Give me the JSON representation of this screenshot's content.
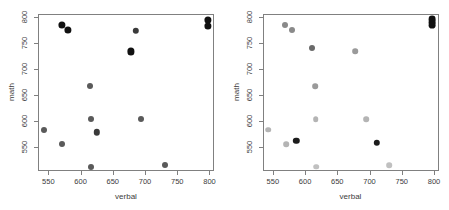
{
  "figure": {
    "panels": [
      {
        "name": "left-panel",
        "xlabel": "verbal",
        "ylabel": "math",
        "xticks": [
          550,
          600,
          650,
          700,
          750,
          800
        ],
        "xticklabels": [
          "550",
          "600",
          "650",
          "700",
          "750",
          "800"
        ],
        "yticks": [
          550,
          600,
          650,
          700,
          750,
          800
        ],
        "yticklabels": [
          "550",
          "600",
          "650",
          "700",
          "750",
          "800"
        ],
        "xlim": [
          534,
          807
        ],
        "ylim": [
          503,
          805
        ]
      },
      {
        "name": "right-panel",
        "xlabel": "verbal",
        "ylabel": "math",
        "xticks": [
          550,
          600,
          650,
          700,
          750,
          800
        ],
        "xticklabels": [
          "550",
          "600",
          "650",
          "700",
          "750",
          "800"
        ],
        "yticks": [
          550,
          600,
          650,
          700,
          750,
          800
        ],
        "yticklabels": [
          "550",
          "600",
          "650",
          "700",
          "750",
          "800"
        ],
        "xlim": [
          534,
          807
        ],
        "ylim": [
          503,
          805
        ]
      }
    ]
  },
  "chart_data": [
    {
      "type": "scatter",
      "title": "",
      "xlabel": "verbal",
      "ylabel": "math",
      "xlim": [
        534,
        807
      ],
      "ylim": [
        503,
        805
      ],
      "xticks": [
        550,
        600,
        650,
        700,
        750,
        800
      ],
      "yticks": [
        550,
        600,
        650,
        700,
        750,
        800
      ],
      "grid": false,
      "legend": false,
      "points": [
        {
          "x": 541,
          "y": 584,
          "color": "#5a5a5a",
          "size": 3.0
        },
        {
          "x": 569,
          "y": 786,
          "color": "#111111",
          "size": 3.6
        },
        {
          "x": 569,
          "y": 557,
          "color": "#5a5a5a",
          "size": 3.0
        },
        {
          "x": 579,
          "y": 777,
          "color": "#111111",
          "size": 3.6
        },
        {
          "x": 613,
          "y": 669,
          "color": "#5a5a5a",
          "size": 3.0
        },
        {
          "x": 614,
          "y": 604,
          "color": "#5a5a5a",
          "size": 3.0
        },
        {
          "x": 615,
          "y": 513,
          "color": "#5a5a5a",
          "size": 3.0
        },
        {
          "x": 624,
          "y": 579,
          "color": "#3a3a3a",
          "size": 3.2
        },
        {
          "x": 676,
          "y": 735,
          "color": "#111111",
          "size": 3.6
        },
        {
          "x": 684,
          "y": 775,
          "color": "#3a3a3a",
          "size": 3.2
        },
        {
          "x": 692,
          "y": 604,
          "color": "#5a5a5a",
          "size": 3.0
        },
        {
          "x": 729,
          "y": 516,
          "color": "#5a5a5a",
          "size": 3.0
        },
        {
          "x": 796,
          "y": 796,
          "color": "#111111",
          "size": 3.6
        },
        {
          "x": 796,
          "y": 784,
          "color": "#111111",
          "size": 3.6
        }
      ]
    },
    {
      "type": "scatter",
      "title": "",
      "xlabel": "verbal",
      "ylabel": "math",
      "xlim": [
        534,
        807
      ],
      "ylim": [
        503,
        805
      ],
      "xticks": [
        550,
        600,
        650,
        700,
        750,
        800
      ],
      "yticks": [
        550,
        600,
        650,
        700,
        750,
        800
      ],
      "grid": false,
      "legend": false,
      "points": [
        {
          "x": 541,
          "y": 584,
          "color": "#b4b4b4",
          "size": 2.8
        },
        {
          "x": 568,
          "y": 786,
          "color": "#8a8a8a",
          "size": 3.0
        },
        {
          "x": 569,
          "y": 557,
          "color": "#b4b4b4",
          "size": 2.8
        },
        {
          "x": 578,
          "y": 777,
          "color": "#8a8a8a",
          "size": 3.0
        },
        {
          "x": 585,
          "y": 563,
          "color": "#1c1c1c",
          "size": 3.2
        },
        {
          "x": 610,
          "y": 742,
          "color": "#6a6a6a",
          "size": 3.0
        },
        {
          "x": 614,
          "y": 668,
          "color": "#9a9a9a",
          "size": 2.8
        },
        {
          "x": 615,
          "y": 604,
          "color": "#b4b4b4",
          "size": 2.8
        },
        {
          "x": 616,
          "y": 513,
          "color": "#c0c0c0",
          "size": 2.8
        },
        {
          "x": 676,
          "y": 735,
          "color": "#9a9a9a",
          "size": 2.8
        },
        {
          "x": 693,
          "y": 604,
          "color": "#b4b4b4",
          "size": 2.8
        },
        {
          "x": 710,
          "y": 559,
          "color": "#1c1c1c",
          "size": 3.2
        },
        {
          "x": 729,
          "y": 516,
          "color": "#c0c0c0",
          "size": 2.8
        },
        {
          "x": 795,
          "y": 797,
          "color": "#111111",
          "size": 3.4
        },
        {
          "x": 796,
          "y": 791,
          "color": "#111111",
          "size": 3.4
        },
        {
          "x": 796,
          "y": 785,
          "color": "#111111",
          "size": 3.4
        }
      ]
    }
  ],
  "style": {
    "axis_color": "#808080",
    "text_color": "#3c3c3c",
    "background": "#ffffff"
  }
}
